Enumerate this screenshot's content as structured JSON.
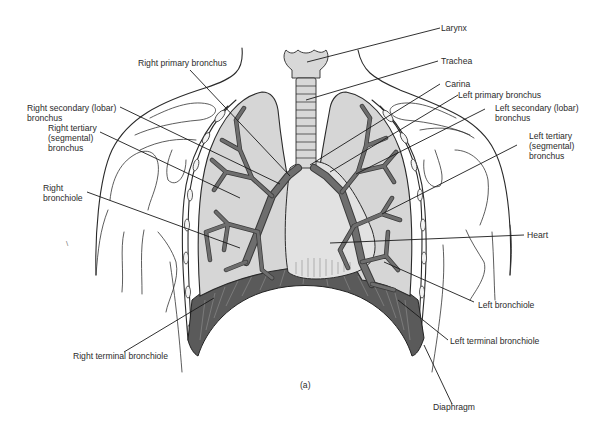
{
  "figure": {
    "caption": "(a)"
  },
  "colors": {
    "lung_fill": "#d6d6d6",
    "bronchi": "#6e6e6e",
    "heart_fill": "#e2e2e2",
    "diaphragm": "#5a5a5a",
    "line": "#2a2a2a",
    "label_text": "#2b2b2b"
  },
  "labels": {
    "larynx": "Larynx",
    "trachea": "Trachea",
    "carina": "Carina",
    "left_primary_bronchus": "Left primary bronchus",
    "left_secondary_bronchus": "Left secondary (lobar)\nbronchus",
    "left_tertiary_bronchus": "Left tertiary\n(segmental)\nbronchus",
    "heart": "Heart",
    "left_bronchiole": "Left bronchiole",
    "left_terminal_bronchiole": "Left terminal bronchiole",
    "diaphragm": "Diaphragm",
    "right_primary_bronchus": "Right primary bronchus",
    "right_secondary_bronchus": "Right secondary (lobar)\nbronchus",
    "right_tertiary_bronchus": "Right tertiary\n(segmental)\nbronchus",
    "right_bronchiole": "Right\nbronchiole",
    "right_terminal_bronchiole": "Right terminal bronchiole"
  }
}
